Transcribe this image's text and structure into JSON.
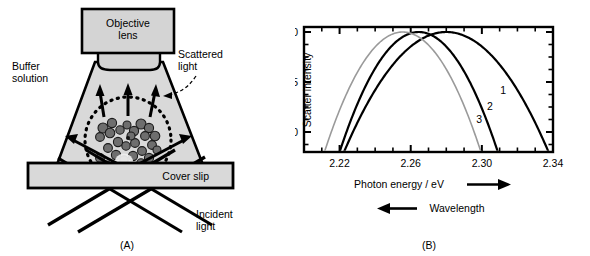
{
  "figure": {
    "panel_a": {
      "caption": "(A)",
      "objective_lens_label_line1": "Objective",
      "objective_lens_label_line2": "lens",
      "buffer_label_line1": "Buffer",
      "buffer_label_line2": "solution",
      "scattered_label_line1": "Scattered",
      "scattered_label_line2": "light",
      "cover_slip_label": "Cover slip",
      "incident_label_line1": "Incident",
      "incident_label_line2": "light",
      "icons": {
        "scattered_arrows": "up-arrow-icon",
        "incident_beams": "beam-line-icon",
        "evanescent_field": "dotted-circle-icon",
        "nanoparticles": "nanoparticle-cluster-icon",
        "callout": "dashed-leader-icon"
      },
      "colors": {
        "fill_light": "#d9d9d9",
        "fill_lens": "#d4d4d4",
        "stroke": "#000000",
        "particle": "#555555"
      }
    },
    "panel_b": {
      "caption": "(B)",
      "xaxis_title": "Photon energy / eV",
      "xaxis_arrow": "right-arrow-icon",
      "secondary_axis_title": "Wavelength",
      "secondary_axis_arrow": "left-arrow-icon",
      "curve_labels": [
        "1",
        "2",
        "3"
      ]
    }
  },
  "chart_data": {
    "type": "line",
    "title": "",
    "xlabel": "Photon energy / eV",
    "ylabel": "Scatter intensity",
    "xlim": [
      2.2,
      2.34
    ],
    "ylim": [
      0.88,
      1.005
    ],
    "xticks": [
      2.22,
      2.26,
      2.3,
      2.34
    ],
    "xtick_labels": [
      "2.22",
      "2.26",
      "2.30",
      "2.34"
    ],
    "x_minor_tick_step": 0.01,
    "yticks": [
      0.9,
      0.95,
      1.0
    ],
    "ytick_labels": [
      "0.90",
      "0.95",
      "1.00"
    ],
    "grid": false,
    "legend": "inline-curve-labels",
    "secondary_xlabel": "Wavelength",
    "secondary_x_direction": "decreasing-to-the-right",
    "series": [
      {
        "name": "1",
        "label": "1",
        "color": "#000000",
        "linewidth": 2.2,
        "peak_x": 2.28,
        "peak_y": 1.0,
        "halfwidth": 0.0575,
        "label_x": 2.312,
        "label_y": 0.938,
        "x": [
          2.2225,
          2.23,
          2.24,
          2.25,
          2.26,
          2.27,
          2.28,
          2.29,
          2.3,
          2.31,
          2.32,
          2.3375
        ],
        "y": [
          0.88,
          0.899,
          0.923,
          0.945,
          0.964,
          0.979,
          0.99,
          0.997,
          1.0,
          0.999,
          0.994,
          0.98
        ]
      },
      {
        "name": "2",
        "label": "2",
        "color": "#000000",
        "linewidth": 2.2,
        "peak_x": 2.2645,
        "peak_y": 1.0,
        "halfwidth": 0.0445,
        "label_x": 2.3045,
        "label_y": 0.922,
        "x": [
          2.22,
          2.23,
          2.24,
          2.25,
          2.26,
          2.265,
          2.27,
          2.28,
          2.29,
          2.3,
          2.309
        ],
        "y": [
          0.88,
          0.919,
          0.954,
          0.979,
          0.997,
          1.0,
          0.999,
          0.987,
          0.965,
          0.933,
          0.898
        ]
      },
      {
        "name": "3",
        "label": "3",
        "color": "#9a9a9a",
        "linewidth": 1.6,
        "peak_x": 2.2555,
        "peak_y": 1.0,
        "halfwidth": 0.044,
        "label_x": 2.2985,
        "label_y": 0.909,
        "x": [
          2.2115,
          2.22,
          2.23,
          2.24,
          2.25,
          2.2555,
          2.26,
          2.27,
          2.28,
          2.29,
          2.2995
        ],
        "y": [
          0.88,
          0.917,
          0.953,
          0.979,
          0.997,
          1.0,
          0.998,
          0.986,
          0.963,
          0.93,
          0.893
        ]
      }
    ]
  }
}
